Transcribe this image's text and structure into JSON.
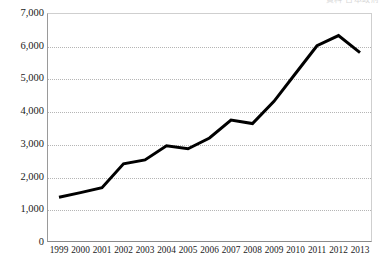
{
  "header": {
    "clipped_text": "資料 日本政府"
  },
  "chart_data": {
    "type": "line",
    "title": "",
    "subtitle": "",
    "xlabel": "",
    "ylabel": "",
    "categories": [
      "1999",
      "2000",
      "2001",
      "2002",
      "2003",
      "2004",
      "2005",
      "2006",
      "2007",
      "2008",
      "2009",
      "2010",
      "2011",
      "2012",
      "2013"
    ],
    "values": [
      1370,
      1510,
      1660,
      2390,
      2510,
      2940,
      2850,
      3180,
      3730,
      3620,
      4300,
      5150,
      6000,
      6310,
      5790
    ],
    "series": [
      {
        "name": "series-1",
        "values": [
          1370,
          1510,
          1660,
          2390,
          2510,
          2940,
          2850,
          3180,
          3730,
          3620,
          4300,
          5150,
          6000,
          6310,
          5790
        ]
      }
    ],
    "ylim": [
      0,
      7000
    ],
    "ytick_values": [
      0,
      1000,
      2000,
      3000,
      4000,
      5000,
      6000,
      7000
    ],
    "ytick_labels": [
      "0",
      "1,000",
      "2,000",
      "3,000",
      "4,000",
      "5,000",
      "6,000",
      "7,000"
    ],
    "grid": true,
    "grid_style": "dotted-horizontal",
    "legend": "none",
    "line_color": "#000000",
    "line_width": 3,
    "axis_color": "#8a8a8a",
    "grid_color": "#b5b5b5",
    "background_color": "#ffffff"
  }
}
